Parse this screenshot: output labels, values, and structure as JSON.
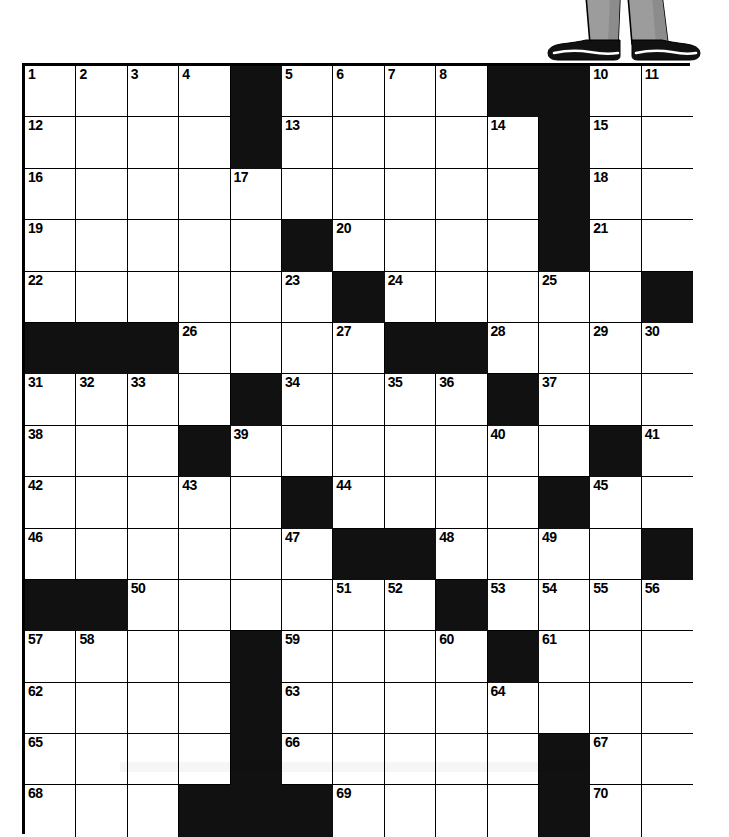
{
  "puzzle": {
    "title": "Crossword Puzzle Grid",
    "columns": 13,
    "rows": 15,
    "cell_size_px": 51.4,
    "colors": {
      "grid_line": "#000000",
      "block": "#111111",
      "cell": "#ffffff",
      "number_text": "#000000"
    },
    "highest_clue_number": 70,
    "layout_note": "1 = white (open) cell, 0 = black (blocked) cell",
    "cells": [
      [
        1,
        1,
        1,
        1,
        0,
        1,
        1,
        1,
        1,
        0,
        0,
        1,
        1
      ],
      [
        1,
        1,
        1,
        1,
        0,
        1,
        1,
        1,
        1,
        1,
        0,
        1,
        1
      ],
      [
        1,
        1,
        1,
        1,
        1,
        1,
        1,
        1,
        1,
        1,
        0,
        1,
        1
      ],
      [
        1,
        1,
        1,
        1,
        1,
        0,
        1,
        1,
        1,
        1,
        0,
        1,
        1
      ],
      [
        1,
        1,
        1,
        1,
        1,
        1,
        0,
        1,
        1,
        1,
        1,
        1,
        0
      ],
      [
        0,
        0,
        0,
        1,
        1,
        1,
        1,
        0,
        0,
        1,
        1,
        1,
        1
      ],
      [
        1,
        1,
        1,
        1,
        0,
        1,
        1,
        1,
        1,
        0,
        1,
        1,
        1
      ],
      [
        1,
        1,
        1,
        0,
        1,
        1,
        1,
        1,
        1,
        1,
        1,
        0,
        1
      ],
      [
        1,
        1,
        1,
        1,
        1,
        0,
        1,
        1,
        1,
        1,
        0,
        1,
        1
      ],
      [
        1,
        1,
        1,
        1,
        1,
        1,
        0,
        0,
        1,
        1,
        1,
        1,
        0
      ],
      [
        0,
        0,
        1,
        1,
        1,
        1,
        1,
        1,
        0,
        1,
        1,
        1,
        1
      ],
      [
        1,
        1,
        1,
        1,
        0,
        1,
        1,
        1,
        1,
        0,
        1,
        1,
        1
      ],
      [
        1,
        1,
        1,
        1,
        0,
        1,
        1,
        1,
        1,
        1,
        1,
        1,
        1
      ],
      [
        1,
        1,
        1,
        1,
        0,
        1,
        1,
        1,
        1,
        1,
        0,
        1,
        1
      ],
      [
        1,
        1,
        1,
        0,
        0,
        0,
        1,
        1,
        1,
        1,
        0,
        1,
        1
      ]
    ],
    "numbers": [
      [
        1,
        2,
        3,
        4,
        null,
        5,
        6,
        7,
        8,
        null,
        null,
        9,
        10
      ],
      [
        12,
        null,
        null,
        null,
        null,
        13,
        null,
        null,
        null,
        14,
        null,
        15,
        null
      ],
      [
        16,
        null,
        null,
        null,
        17,
        null,
        null,
        null,
        null,
        null,
        null,
        18,
        null
      ],
      [
        19,
        null,
        null,
        null,
        null,
        null,
        20,
        null,
        null,
        null,
        null,
        21,
        null
      ],
      [
        22,
        null,
        null,
        null,
        null,
        23,
        null,
        24,
        null,
        null,
        25,
        null,
        null
      ],
      [
        null,
        null,
        null,
        26,
        null,
        null,
        27,
        null,
        null,
        28,
        null,
        null,
        29
      ],
      [
        31,
        32,
        33,
        null,
        null,
        34,
        null,
        35,
        36,
        null,
        37,
        null,
        null
      ],
      [
        38,
        null,
        null,
        null,
        39,
        null,
        null,
        null,
        null,
        40,
        null,
        null,
        41
      ],
      [
        42,
        null,
        null,
        43,
        null,
        null,
        44,
        null,
        null,
        null,
        null,
        45,
        null
      ],
      [
        46,
        null,
        null,
        null,
        null,
        47,
        null,
        null,
        48,
        null,
        49,
        null,
        null
      ],
      [
        null,
        null,
        50,
        null,
        null,
        null,
        51,
        52,
        null,
        53,
        null,
        null,
        54
      ],
      [
        57,
        58,
        null,
        null,
        null,
        59,
        null,
        null,
        60,
        null,
        61,
        null,
        null
      ],
      [
        62,
        null,
        null,
        null,
        null,
        63,
        null,
        null,
        null,
        64,
        null,
        null,
        null
      ],
      [
        65,
        null,
        null,
        null,
        null,
        66,
        null,
        null,
        null,
        null,
        null,
        67,
        null
      ],
      [
        68,
        null,
        null,
        null,
        null,
        null,
        69,
        null,
        null,
        null,
        null,
        70,
        null
      ]
    ],
    "extra_numbers": {
      "row0_col12_right": 11,
      "row5_col12_second": 30,
      "row10_col11": 55,
      "row10_col12": 56
    },
    "number_overrides": [
      {
        "row": 0,
        "col": 12,
        "value": 11
      },
      {
        "row": 0,
        "col": 11,
        "value": 10
      },
      {
        "row": 5,
        "col": 11,
        "value": 29
      },
      {
        "row": 5,
        "col": 12,
        "value": 30
      },
      {
        "row": 10,
        "col": 10,
        "value": 54
      },
      {
        "row": 10,
        "col": 11,
        "value": 55
      },
      {
        "row": 10,
        "col": 12,
        "value": 56
      }
    ]
  },
  "illustration": {
    "name": "person-legs-standing-on-puzzle",
    "description": "Lower half of a person: gray trouser legs and black dress shoes standing on the top edge of the crossword grid",
    "trouser_color": "#9a9a9a",
    "trouser_shade_color": "#8a8a8a",
    "shoe_color": "#111111",
    "highlight_color": "#ffffff"
  }
}
